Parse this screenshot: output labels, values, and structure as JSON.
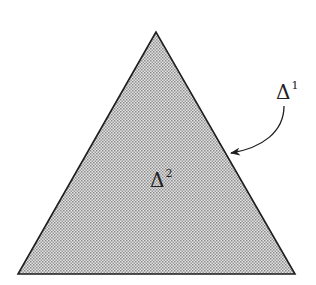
{
  "diagram": {
    "triangle": {
      "apex": [
        156,
        32
      ],
      "base_left": [
        18,
        274
      ],
      "base_right": [
        295,
        274
      ],
      "fill": "#c9c9c9",
      "stroke": "#1e1e1e"
    },
    "labels": {
      "boundary": {
        "symbol": "Δ",
        "superscript": "1"
      },
      "interior": {
        "symbol": "Δ",
        "superscript": "2"
      }
    },
    "arrow": {
      "from": [
        284,
        105
      ],
      "to": [
        230,
        153
      ],
      "target": "triangle-right-edge"
    }
  }
}
